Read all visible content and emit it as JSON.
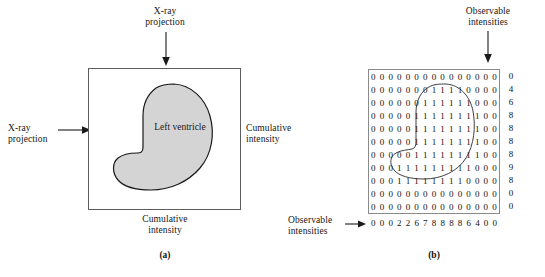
{
  "figure": {
    "panel_a": {
      "caption": "(a)",
      "box_label": "Left\nventricle",
      "top_arrow_label": "X-ray\nprojection",
      "left_arrow_label": "X-ray\nprojection",
      "right_label": "Cumulative\nintensity",
      "bottom_label": "Cumulative\nintensity"
    },
    "panel_b": {
      "caption": "(b)",
      "top_label": "Observable\nintensities",
      "left_label": "Observable\nintensities"
    }
  },
  "chart_data": {
    "type": "heatmap",
    "title": "",
    "xlabel": "Observable intensities",
    "ylabel": "Observable intensities",
    "rows": 11,
    "cols": 15,
    "grid": [
      [
        0,
        0,
        0,
        0,
        0,
        0,
        0,
        0,
        0,
        0,
        0,
        0,
        0,
        0,
        0
      ],
      [
        0,
        0,
        0,
        0,
        0,
        0,
        0,
        1,
        1,
        1,
        1,
        0,
        0,
        0,
        0
      ],
      [
        0,
        0,
        0,
        0,
        0,
        0,
        1,
        1,
        1,
        1,
        1,
        1,
        0,
        0,
        0
      ],
      [
        0,
        0,
        0,
        0,
        0,
        1,
        1,
        1,
        1,
        1,
        1,
        1,
        1,
        0,
        0
      ],
      [
        0,
        0,
        0,
        0,
        0,
        1,
        1,
        1,
        1,
        1,
        1,
        1,
        1,
        0,
        0
      ],
      [
        0,
        0,
        0,
        0,
        0,
        1,
        1,
        1,
        1,
        1,
        1,
        1,
        1,
        0,
        0
      ],
      [
        0,
        0,
        0,
        0,
        0,
        1,
        1,
        1,
        1,
        1,
        1,
        1,
        1,
        0,
        0
      ],
      [
        0,
        0,
        0,
        1,
        1,
        1,
        1,
        1,
        1,
        1,
        1,
        1,
        0,
        0,
        0
      ],
      [
        0,
        0,
        0,
        1,
        1,
        1,
        1,
        1,
        1,
        1,
        1,
        0,
        0,
        0,
        0
      ],
      [
        0,
        0,
        0,
        0,
        0,
        0,
        0,
        0,
        0,
        0,
        0,
        0,
        0,
        0,
        0
      ],
      [
        0,
        0,
        0,
        0,
        0,
        0,
        0,
        0,
        0,
        0,
        0,
        0,
        0,
        0,
        0
      ]
    ],
    "row_sums": [
      0,
      4,
      6,
      8,
      8,
      8,
      8,
      9,
      8,
      0,
      0
    ],
    "col_sums": [
      0,
      0,
      0,
      2,
      2,
      6,
      7,
      8,
      8,
      8,
      8,
      6,
      4,
      0,
      0
    ]
  },
  "colors": {
    "ventricle_fill": "#d4d4d4",
    "ventricle_stroke": "#1a1a1a",
    "box_border": "#5d5d5d",
    "grid_border": "#8a8a8a",
    "text": "#151515"
  }
}
